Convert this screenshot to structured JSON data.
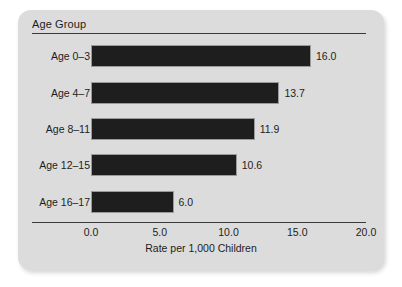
{
  "panel": {
    "title": "Age Group"
  },
  "chart_data": {
    "type": "bar",
    "orientation": "horizontal",
    "title": "Age Group",
    "xlabel": "Rate per 1,000 Children",
    "ylabel": "Age Group",
    "categories": [
      "Age 0–3",
      "Age 4–7",
      "Age 8–11",
      "Age 12–15",
      "Age 16–17"
    ],
    "values": [
      16.0,
      13.7,
      11.9,
      10.6,
      6.0
    ],
    "value_labels": [
      "16.0",
      "13.7",
      "11.9",
      "10.6",
      "6.0"
    ],
    "xlim": [
      0,
      20
    ],
    "xticks": [
      0,
      5,
      10,
      15,
      20
    ],
    "xtick_labels": [
      "0.0",
      "5.0",
      "10.0",
      "15.0",
      "20.0"
    ],
    "grid": false,
    "legend": null,
    "bar_color": "#1e1e1e",
    "panel_color": "#dcdcdc",
    "text_color": "#1c1c1c"
  }
}
